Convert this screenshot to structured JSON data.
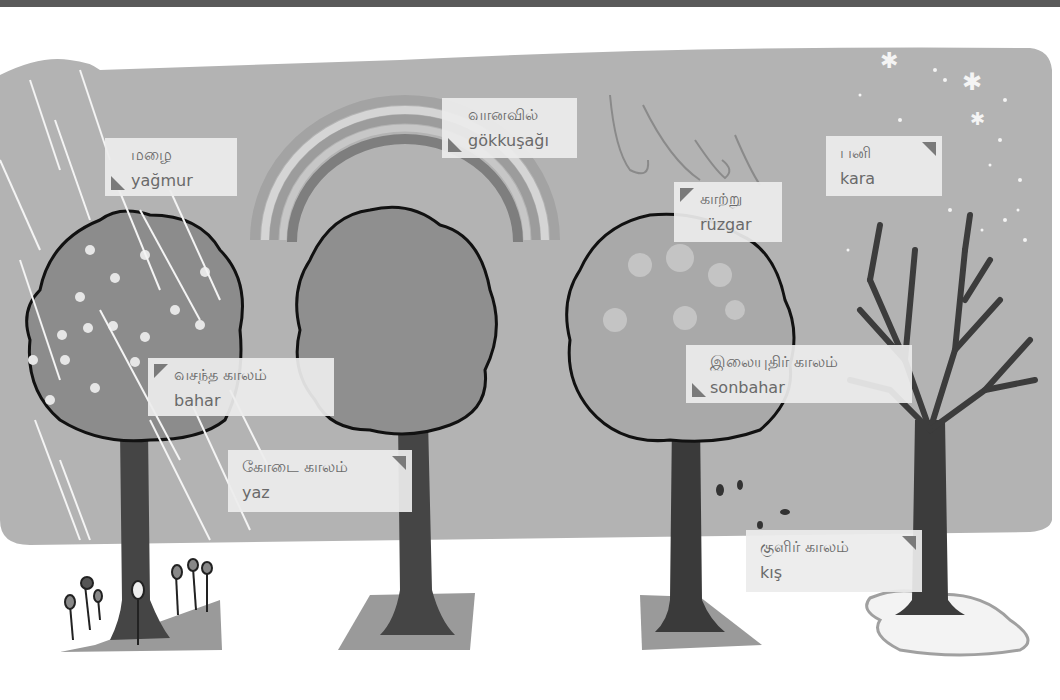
{
  "colors": {
    "sky": "#b3b3b3",
    "ground_patch": "#9a9a9a",
    "label_bg": "#ececec",
    "label_text": "#6a6a6a",
    "trunk": "#3f3f3f",
    "canopy_spring": "#8c8c8c",
    "canopy_summer": "#8f8f8f",
    "canopy_autumn": "#a9a9a9",
    "top_strip": "#5a5a5a"
  },
  "labels": {
    "rain": {
      "tamil": "மழை",
      "turkish": "yağmur",
      "icon": "label-pointer-bottom-left"
    },
    "rainbow": {
      "tamil": "வானவில்",
      "turkish": "gökkuşağı",
      "icon": "label-pointer-bottom-left"
    },
    "wind": {
      "tamil": "காற்று",
      "turkish": "rüzgar",
      "icon": "label-pointer-top-left"
    },
    "snow": {
      "tamil": "பனி",
      "turkish": "kara",
      "icon": "label-pointer-top-right"
    },
    "spring": {
      "tamil": "வசந்த காலம்",
      "turkish": "bahar",
      "icon": "label-pointer-top-left"
    },
    "summer": {
      "tamil": "கோடை காலம்",
      "turkish": "yaz",
      "icon": "label-pointer-top-right"
    },
    "autumn": {
      "tamil": "இலையுதிர் காலம்",
      "turkish": "sonbahar",
      "icon": "label-pointer-bottom-left"
    },
    "winter": {
      "tamil": "குளிர் காலம்",
      "turkish": "kış",
      "icon": "label-pointer-top-right"
    }
  }
}
